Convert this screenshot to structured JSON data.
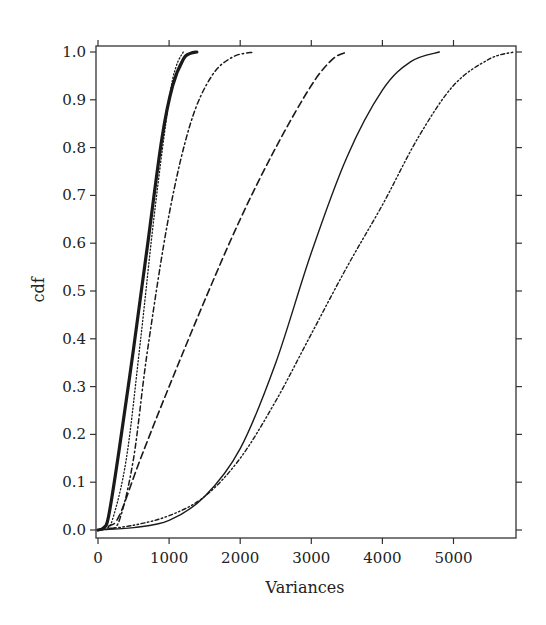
{
  "chart_data": {
    "type": "line",
    "title": "",
    "xlabel": "Variances",
    "ylabel": "cdf",
    "xlim": [
      -30,
      5890
    ],
    "ylim": [
      -0.01,
      1.013
    ],
    "grid": false,
    "legend": null,
    "x_ticks": [
      0,
      1000,
      2000,
      3000,
      4000,
      5000
    ],
    "x_tick_labels": [
      "0",
      "1000",
      "2000",
      "3000",
      "4000",
      "5000"
    ],
    "y_ticks": [
      0.0,
      0.1,
      0.2,
      0.3,
      0.4,
      0.5,
      0.6,
      0.7,
      0.8,
      0.9,
      1.0
    ],
    "y_tick_labels": [
      "0.0",
      "0.1",
      "0.2",
      "0.3",
      "0.4",
      "0.5",
      "0.6",
      "0.7",
      "0.8",
      "0.9",
      "1.0"
    ],
    "series": [
      {
        "name": "thick-solid",
        "style": "solid",
        "width": 3.2,
        "x": [
          0,
          80,
          150,
          300,
          500,
          700,
          900,
          1050,
          1200,
          1300,
          1390
        ],
        "y": [
          0,
          0.005,
          0.03,
          0.17,
          0.38,
          0.6,
          0.82,
          0.93,
          0.985,
          0.997,
          1.0
        ]
      },
      {
        "name": "dotted",
        "style": "dotted",
        "width": 1.3,
        "x": [
          0,
          100,
          200,
          400,
          600,
          800,
          1000,
          1100,
          1200
        ],
        "y": [
          0,
          0.005,
          0.02,
          0.15,
          0.4,
          0.67,
          0.9,
          0.97,
          1.0
        ]
      },
      {
        "name": "dash-dot",
        "style": "dashdot",
        "width": 1.5,
        "x": [
          0,
          150,
          300,
          500,
          700,
          1000,
          1300,
          1600,
          1900,
          2200
        ],
        "y": [
          0,
          0.003,
          0.02,
          0.15,
          0.38,
          0.66,
          0.85,
          0.95,
          0.99,
          1.0
        ]
      },
      {
        "name": "long-dash",
        "style": "dashed",
        "width": 1.6,
        "x": [
          0,
          150,
          300,
          600,
          1000,
          1500,
          2000,
          2500,
          3000,
          3300,
          3500
        ],
        "y": [
          0,
          0.008,
          0.03,
          0.15,
          0.3,
          0.48,
          0.65,
          0.8,
          0.93,
          0.985,
          1.0
        ]
      },
      {
        "name": "thin-solid",
        "style": "solid",
        "width": 1.4,
        "x": [
          0,
          500,
          1000,
          1500,
          2000,
          2500,
          3000,
          3500,
          4000,
          4400,
          4800
        ],
        "y": [
          0,
          0.005,
          0.02,
          0.07,
          0.17,
          0.35,
          0.58,
          0.78,
          0.92,
          0.98,
          1.0
        ]
      },
      {
        "name": "dash-dot-dot",
        "style": "dashdotdot",
        "width": 1.4,
        "x": [
          0,
          500,
          1000,
          1500,
          2000,
          2500,
          3000,
          3500,
          4000,
          4500,
          5000,
          5500,
          5850
        ],
        "y": [
          0,
          0.01,
          0.03,
          0.07,
          0.15,
          0.27,
          0.41,
          0.55,
          0.68,
          0.82,
          0.93,
          0.985,
          1.0
        ]
      }
    ]
  },
  "colors": {
    "line": "#1a1a1a",
    "axis": "#333333",
    "background": "#ffffff"
  }
}
